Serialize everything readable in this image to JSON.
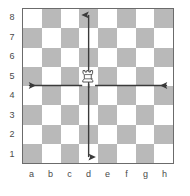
{
  "chart_data": {
    "type": "diagram",
    "board": {
      "files": [
        "a",
        "b",
        "c",
        "d",
        "e",
        "f",
        "g",
        "h"
      ],
      "ranks": [
        "8",
        "7",
        "6",
        "5",
        "4",
        "3",
        "2",
        "1"
      ],
      "size": 8,
      "light_square_color": "#ffffff",
      "dark_square_color": "#b9b9b9",
      "border_color": "#6b6b6b",
      "a8_is_light": true
    },
    "pieces": [
      {
        "type": "rook",
        "color": "white",
        "square": "d5",
        "file": "d",
        "rank": "5"
      }
    ],
    "arrows": [
      {
        "name": "arrow-up",
        "from": "d5",
        "to": "d8",
        "direction": "up",
        "color": "#3a3a3a"
      },
      {
        "name": "arrow-down",
        "from": "d5",
        "to": "d1",
        "direction": "down",
        "color": "#3a3a3a"
      },
      {
        "name": "arrow-left",
        "from": "d5",
        "to": "a5",
        "direction": "left",
        "color": "#3a3a3a"
      },
      {
        "name": "arrow-right",
        "from": "d5",
        "to": "h5",
        "direction": "right",
        "color": "#3a3a3a"
      }
    ],
    "label_color": "#4a4a4a"
  },
  "board": {
    "files": [
      {
        "label": "a"
      },
      {
        "label": "b"
      },
      {
        "label": "c"
      },
      {
        "label": "d"
      },
      {
        "label": "e"
      },
      {
        "label": "f"
      },
      {
        "label": "g"
      },
      {
        "label": "h"
      }
    ],
    "ranks": [
      {
        "label": "8"
      },
      {
        "label": "7"
      },
      {
        "label": "6"
      },
      {
        "label": "5"
      },
      {
        "label": "4"
      },
      {
        "label": "3"
      },
      {
        "label": "2"
      },
      {
        "label": "1"
      }
    ]
  },
  "piece": {
    "name": "white-rook",
    "square": "d5"
  }
}
